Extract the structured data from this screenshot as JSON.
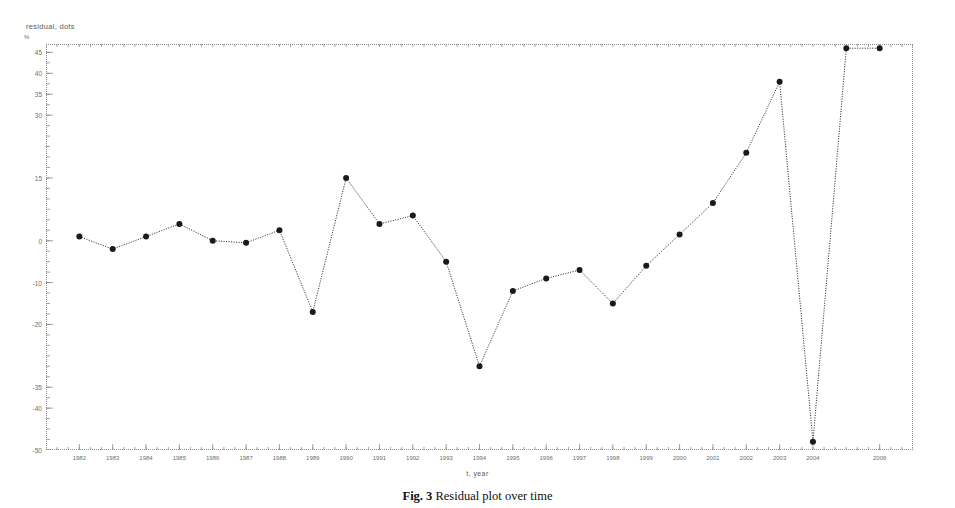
{
  "figure": {
    "caption_label": "Fig. 3",
    "caption_text": " Residual plot over time"
  },
  "chart_data": {
    "type": "line",
    "title": "",
    "xlabel": "t, year",
    "ylabel": "residual, dots",
    "yunit": "%",
    "grid": false,
    "legend": "none",
    "marker": "filled-circle",
    "linestyle": "dotted",
    "color": "#1a1a1a",
    "xlim": [
      1981,
      2007
    ],
    "ylim": [
      -50,
      47
    ],
    "yticks": [
      45,
      40,
      35,
      30,
      15,
      0,
      -10,
      -20,
      -35,
      -40,
      -50
    ],
    "ytick_labels": [
      "45",
      "40",
      "35",
      "30",
      "15",
      "0",
      "-10",
      "-20",
      "-35",
      "-40",
      "-50"
    ],
    "xticks": [
      1982,
      1983,
      1984,
      1985,
      1986,
      1987,
      1988,
      1989,
      1990,
      1991,
      1992,
      1993,
      1994,
      1995,
      1996,
      1997,
      1998,
      1999,
      2000,
      2001,
      2002,
      2003,
      2004,
      2006
    ],
    "xtick_labels": [
      "1982",
      "1983",
      "1984",
      "1985",
      "1986",
      "1987",
      "1988",
      "1989",
      "1990",
      "1991",
      "1992",
      "1993",
      "1994",
      "1995",
      "1996",
      "1997",
      "1998",
      "1999",
      "2000",
      "2001",
      "2002",
      "2003",
      "2004",
      "2006"
    ],
    "x": [
      1982,
      1983,
      1984,
      1985,
      1986,
      1987,
      1988,
      1989,
      1990,
      1991,
      1992,
      1993,
      1994,
      1995,
      1996,
      1997,
      1998,
      1999,
      2000,
      2001,
      2002,
      2003,
      2004,
      2005,
      2006
    ],
    "values": [
      1.0,
      -2.0,
      1.0,
      4.0,
      0.0,
      -0.5,
      2.5,
      -17.0,
      15.0,
      4.0,
      6.0,
      -5.0,
      -30.0,
      -12.0,
      -9.0,
      -7.0,
      -15.0,
      -6.0,
      1.5,
      9.0,
      21.0,
      38.0,
      -48.0,
      46.0,
      46.0
    ],
    "series_name": "residual"
  }
}
